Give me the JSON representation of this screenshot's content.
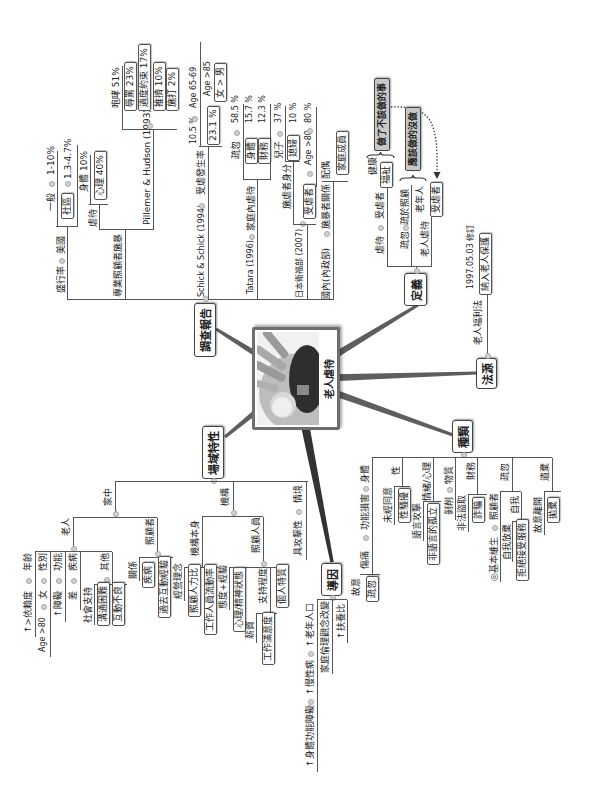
{
  "central_topic": {
    "label": "老人虐待",
    "image": "elder-abuse-illustration"
  },
  "survey": {
    "title": "調查報告",
    "prevalence": {
      "label": "盛行率",
      "region": "美國",
      "general": "一般",
      "general_rate": "1-10%",
      "community": "社區",
      "community_rate": "1.3-4.7%"
    },
    "professional": {
      "label": "專業照顧者施暴",
      "abuse": "虐待",
      "physical": "身體",
      "physical_rate": "10%",
      "psychological": "心理",
      "psychological_rate": "40%",
      "study": "Pillemer & Hudson (1993)",
      "items": [
        {
          "label": "咆哮",
          "value": "51%"
        },
        {
          "label": "辱罵",
          "value": "23%"
        },
        {
          "label": "過度約束",
          "value": "17%"
        },
        {
          "label": "推擠",
          "value": "10%"
        },
        {
          "label": "施打",
          "value": "2%"
        }
      ]
    },
    "schick": {
      "study": "Schick & Schick (1994)",
      "label": "受虐發生率",
      "rate_a": "10.5 %",
      "age_a": "Age 65-69",
      "rate_b": "23.1 %",
      "age_b": "Age >85",
      "gender": "女 > 男"
    },
    "tatara": {
      "study": "Tatara (1996)",
      "label": "家庭內虐待",
      "items": [
        {
          "label": "疏忽",
          "value": "58.5 %"
        },
        {
          "label": "身體",
          "value": "15.7 %"
        },
        {
          "label": "財務",
          "value": "12.3 %"
        }
      ]
    },
    "japan": {
      "study": "日本衛福部 (2007)",
      "abuser_label": "施虐者身分",
      "abusers": [
        {
          "label": "兒子",
          "value": "37 %"
        },
        {
          "label": "媳婦",
          "value": "10 %"
        }
      ],
      "victim_label": "受虐者",
      "victim_age": "Age >80",
      "victim_rate": "80 %"
    },
    "domestic": {
      "study": "國內(內政部)",
      "label": "施暴者關係",
      "spouse": "配偶",
      "family": "家庭成員"
    }
  },
  "definition": {
    "title": "定義",
    "rows": [
      {
        "term": "虐待",
        "subject": "受虐者",
        "aspects": [
          "健康",
          "福祉"
        ]
      },
      {
        "term": "疏忽",
        "subject": "疏於照顧"
      },
      {
        "term": "老人虐待",
        "subject": "老年人",
        "victim": "受虐者"
      }
    ],
    "commission": "做了不該做的事",
    "omission": "應該做的沒做"
  },
  "legal": {
    "title": "法源",
    "law": "老人福利法",
    "amendment": "1997.05.03 修訂",
    "inclusion": "納入老人保護"
  },
  "types": {
    "title": "種類",
    "physical": {
      "label": "身體",
      "impairment": "功能損害",
      "injury": "傷痛",
      "intentional": "故意",
      "neglect": "疏忽"
    },
    "sexual": {
      "label": "性",
      "non_consent": "未經同意",
      "harassment": "性騷擾"
    },
    "emotional": {
      "label": "情緒/心理",
      "verbal": "語言攻擊",
      "nonverbal": "非語言的孤立"
    },
    "material": {
      "label": "物質",
      "exploitation": "剝削"
    },
    "financial": {
      "label": "財務",
      "theft": "非法盜取",
      "fraud": "詐騙"
    },
    "neglect": {
      "label": "疏忽",
      "caregiver": "照顧者",
      "basic_needs": "◎基本維生",
      "self": "自我",
      "self_neglect": "自我放棄",
      "refuse_service": "拒絕接受服務"
    },
    "abandonment": {
      "label": "遺棄",
      "deliberate_leave": "故意離開",
      "desert": "拋棄"
    }
  },
  "setting": {
    "title": "場域特性",
    "home": {
      "label": "家中",
      "elder": {
        "label": "老人",
        "rows": [
          {
            "factor": "年齡",
            "effect": "↑>依賴度"
          },
          {
            "factor": "性別",
            "effect": "女",
            "detail": "Age >80"
          },
          {
            "factor": "功能",
            "effect": "↑障礙"
          },
          {
            "factor": "疾病",
            "effect": "差"
          }
        ],
        "other": {
          "label": "其他",
          "items": [
            "社會支持",
            "溝通困難",
            "互動不良"
          ]
        }
      },
      "caregiver": {
        "label": "照顧者",
        "items": [
          "關係",
          "疾病",
          "過去互動經驗"
        ]
      }
    },
    "institution": {
      "label": "機構",
      "itself": {
        "label": "機構本身",
        "items": [
          "經營理念",
          "照顧人力比",
          "工作人員流動率"
        ]
      },
      "staff": {
        "label": "照顧人員",
        "attitude": "態度+經驗",
        "mental": "心理/精神狀態",
        "support": "支持程度",
        "salary": "薪資",
        "satisfaction": "工作滿意度",
        "traits": "個人特質"
      }
    },
    "situation": {
      "label": "情境",
      "aggressive": "具攻擊性"
    }
  },
  "causes": {
    "title": "導因",
    "demographic": [
      "↑老年人口",
      "↑慢性病",
      "↑身體功能障礙"
    ],
    "family_ethics": "家庭倫理觀念改變",
    "dependency": "↑扶養比"
  },
  "colors": {
    "line": "#555555",
    "branch": "#5e5e5e",
    "gray_box": "#c8c8c8",
    "frame": "#6e6e6e"
  }
}
